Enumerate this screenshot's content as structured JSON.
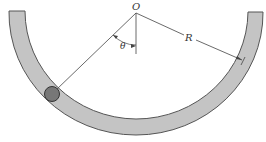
{
  "diagram": {
    "title": "",
    "labels": {
      "origin": "O",
      "angle": "θ",
      "radius": "R"
    },
    "colors": {
      "track_fill": "#c4c4c4",
      "track_stroke": "#555555",
      "ball_fill": "#777777",
      "ball_stroke": "#333333",
      "line": "#444444",
      "background": "#ffffff"
    },
    "elements": [
      {
        "id": "track",
        "type": "semicircular-channel"
      },
      {
        "id": "ball",
        "type": "sphere-in-channel"
      },
      {
        "id": "radius-line-to-ball"
      },
      {
        "id": "vertical-reference-line"
      },
      {
        "id": "radius-dimension-R"
      },
      {
        "id": "angle-arc-theta"
      }
    ]
  }
}
